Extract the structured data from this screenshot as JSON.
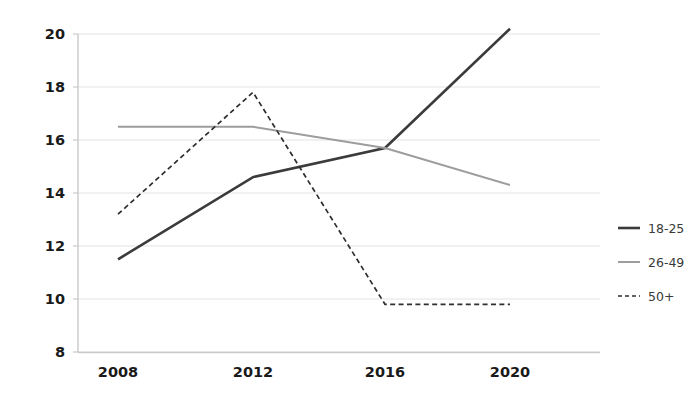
{
  "chart_data": {
    "type": "line",
    "title": "",
    "subtitle": "",
    "xlabel": "",
    "ylabel": "",
    "categories": [
      "2008",
      "2012",
      "2016",
      "2020"
    ],
    "x": [
      2008,
      2012,
      2016,
      2020
    ],
    "xlim": [
      2008,
      2020
    ],
    "ylim": [
      8,
      20
    ],
    "yticks": [
      "8",
      "10",
      "12",
      "14",
      "16",
      "18",
      "20"
    ],
    "ytick_values": [
      8,
      10,
      12,
      14,
      16,
      18,
      20
    ],
    "xticks": [
      "2008",
      "2012",
      "2016",
      "2020"
    ],
    "grid": "horizontal",
    "legend_position": "right",
    "series": [
      {
        "name": "18-25",
        "values": [
          11.5,
          14.6,
          15.7,
          20.2
        ],
        "color": "#3b3b3b",
        "style": "solid",
        "width": 2.6
      },
      {
        "name": "26-49",
        "values": [
          16.5,
          16.5,
          15.7,
          14.3
        ],
        "color": "#9d9d9d",
        "style": "solid",
        "width": 2.0
      },
      {
        "name": "50+",
        "values": [
          13.2,
          17.8,
          9.8,
          9.8
        ],
        "color": "#2e2e2e",
        "style": "dashed",
        "width": 1.7
      }
    ]
  },
  "legend": {
    "items": [
      {
        "label": "18-25"
      },
      {
        "label": "26-49"
      },
      {
        "label": "50+"
      }
    ]
  },
  "axes": {
    "y_tick_labels": [
      "20",
      "18",
      "16",
      "14",
      "12",
      "10",
      "8"
    ],
    "x_tick_labels": [
      "2008",
      "2012",
      "2016",
      "2020"
    ]
  },
  "colors": {
    "background": "#ffffff",
    "gridline": "#e3e3e3",
    "axis": "#c9c9c9",
    "tick_label": "#1a1a1a",
    "series_young": "#3b3b3b",
    "series_mid": "#9d9d9d",
    "series_old": "#2e2e2e"
  }
}
